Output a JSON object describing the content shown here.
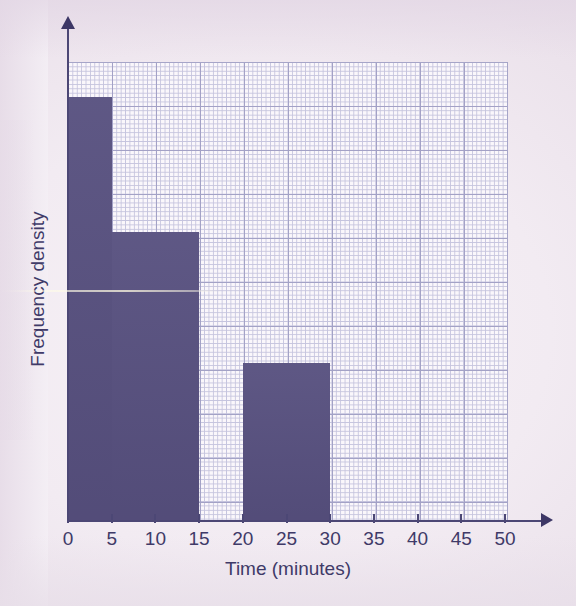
{
  "chart_data": {
    "type": "bar",
    "title": "",
    "subtitle": "",
    "xlabel": "Time (minutes)",
    "ylabel": "Frequency density",
    "xlim": [
      0,
      50
    ],
    "ylim": [
      0,
      5.2
    ],
    "xticks": [
      0,
      5,
      10,
      15,
      20,
      25,
      30,
      35,
      40,
      45,
      50
    ],
    "xtick_labels": [
      "0",
      "5",
      "10",
      "15",
      "20",
      "25",
      "30",
      "35",
      "40",
      "45",
      "50"
    ],
    "yticks": [],
    "ytick_labels": [],
    "grid": true,
    "grid_style": "graph-paper, fine 0.1 squares with major lines every 0.5 unit",
    "legend": null,
    "bar_color": "#57507f",
    "grid_major_color": "#9f9ec4",
    "grid_minor_color": "#c3c2dd",
    "axis_color": "#4c4775",
    "plot_background": "#fbf8fc",
    "page_background": "#ece2ec",
    "bins": [
      {
        "label": "0-5",
        "x_start": 0,
        "x_end": 5,
        "frequency_density": 4.8
      },
      {
        "label": "5-15",
        "x_start": 5,
        "x_end": 15,
        "frequency_density": 3.27
      },
      {
        "label": "15-20",
        "x_start": 15,
        "x_end": 20,
        "frequency_density": 0
      },
      {
        "label": "20-30",
        "x_start": 20,
        "x_end": 30,
        "frequency_density": 1.79
      },
      {
        "label": "30-50",
        "x_start": 30,
        "x_end": 50,
        "frequency_density": 0
      }
    ],
    "categories": [
      "0-5",
      "5-15",
      "15-20",
      "20-30",
      "30-50"
    ],
    "values": [
      4.8,
      3.27,
      0,
      1.79,
      0
    ]
  },
  "axes": {
    "x_title": "Time (minutes)",
    "y_title": "Frequency density",
    "x_tick_labels": [
      "0",
      "5",
      "10",
      "15",
      "20",
      "25",
      "30",
      "35",
      "40",
      "45",
      "50"
    ]
  },
  "icons": {
    "x_arrow": "arrow-right-icon",
    "y_arrow": "arrow-up-icon"
  }
}
